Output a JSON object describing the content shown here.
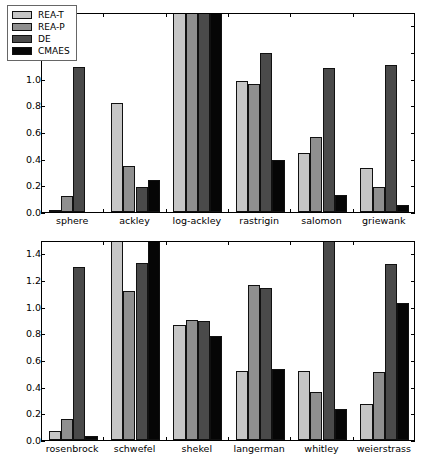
{
  "chart_data": {
    "type": "bar",
    "title": "",
    "xlabel": "",
    "ylabel": "",
    "ylim": [
      0.0,
      1.5
    ],
    "yticks": [
      "0.0",
      "0.2",
      "0.4",
      "0.6",
      "0.8",
      "1.0",
      "1.2",
      "1.4"
    ],
    "ytick_values": [
      0.0,
      0.2,
      0.4,
      0.6,
      0.8,
      1.0,
      1.2,
      1.4
    ],
    "grid": false,
    "legend": {
      "position": "upper-left",
      "entries": [
        {
          "name": "REA-T",
          "color": "#c6c6c6"
        },
        {
          "name": "REA-P",
          "color": "#8f8f8f"
        },
        {
          "name": "DE",
          "color": "#4a4a4a"
        },
        {
          "name": "CMAES",
          "color": "#060606"
        }
      ]
    },
    "series_names": [
      "REA-T",
      "REA-P",
      "DE",
      "CMAES"
    ],
    "series_colors": [
      "#c6c6c6",
      "#8f8f8f",
      "#4a4a4a",
      "#060606"
    ],
    "panels": [
      {
        "panel_id": "top",
        "categories": [
          "sphere",
          "ackley",
          "log-ackley",
          "rastrigin",
          "salomon",
          "griewank"
        ],
        "series": [
          {
            "name": "REA-T",
            "values": [
              0.01,
              0.815,
              1.5,
              0.98,
              0.445,
              0.33
            ]
          },
          {
            "name": "REA-P",
            "values": [
              0.12,
              0.345,
              1.5,
              0.96,
              0.565,
              0.185
            ]
          },
          {
            "name": "DE",
            "values": [
              1.09,
              0.19,
              1.5,
              1.195,
              1.08,
              1.1
            ]
          },
          {
            "name": "CMAES",
            "values": [
              0.0,
              0.24,
              1.5,
              0.39,
              0.125,
              0.055
            ]
          }
        ]
      },
      {
        "panel_id": "bottom",
        "categories": [
          "rosenbrock",
          "schwefel",
          "shekel",
          "langerman",
          "whitley",
          "weierstrass"
        ],
        "series": [
          {
            "name": "REA-T",
            "values": [
              0.065,
              1.5,
              0.865,
              0.515,
              0.52,
              0.27
            ]
          },
          {
            "name": "REA-P",
            "values": [
              0.16,
              1.12,
              0.9,
              1.16,
              0.36,
              0.51
            ]
          },
          {
            "name": "DE",
            "values": [
              1.3,
              1.325,
              0.895,
              1.14,
              1.5,
              1.32
            ]
          },
          {
            "name": "CMAES",
            "values": [
              0.03,
              1.5,
              0.78,
              0.535,
              0.235,
              1.03
            ]
          }
        ]
      }
    ]
  }
}
